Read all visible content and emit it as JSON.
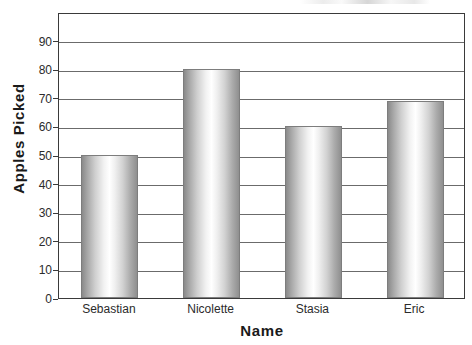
{
  "chart_data": {
    "type": "bar",
    "title": "",
    "xlabel": "Name",
    "ylabel": "Apples Picked",
    "categories": [
      "Sebastian",
      "Nicolette",
      "Stasia",
      "Eric"
    ],
    "values": [
      50,
      80,
      60,
      69
    ],
    "series": [
      {
        "name": "Apples Picked",
        "values": [
          50,
          80,
          60,
          69
        ]
      }
    ],
    "ylim": [
      0,
      100
    ],
    "yticks": [
      0,
      10,
      20,
      30,
      40,
      50,
      60,
      70,
      80,
      90
    ],
    "ytick_labels": [
      "0",
      "10",
      "20",
      "30",
      "40",
      "50",
      "60",
      "70",
      "80",
      "90"
    ],
    "grid": true,
    "grid_axis": "y",
    "legend": false,
    "legend_position": "none",
    "bar_fill": "#d9d9d9",
    "bar_edge_color": "#7d7d7d",
    "axis_color": "#3a3a3a",
    "gridline_color": "#6b6b6b",
    "text_color": "#2b2b2b",
    "background": "#ffffff"
  },
  "chart": {
    "y_axis_title": "Apples Picked",
    "x_axis_title": "Name",
    "clipped_title_artifact": ""
  }
}
